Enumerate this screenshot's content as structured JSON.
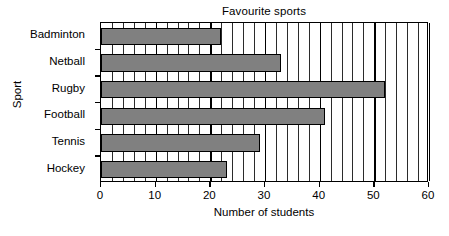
{
  "chart_data": {
    "type": "bar",
    "orientation": "horizontal",
    "title": "Favourite sports",
    "xlabel": "Number of students",
    "ylabel": "Sport",
    "categories": [
      "Badminton",
      "Netball",
      "Rugby",
      "Football",
      "Tennis",
      "Hockey"
    ],
    "values": [
      22,
      33,
      52,
      41,
      29,
      23
    ],
    "xlim": [
      0,
      60
    ],
    "xticks": [
      0,
      10,
      20,
      30,
      40,
      50,
      60
    ],
    "xtick_labels": [
      "0",
      "10",
      "20",
      "30",
      "40",
      "50",
      "60"
    ],
    "gridline_interval": 2,
    "grid": true,
    "legend": false,
    "bar_color": "#808080",
    "bar_border_color": "#000000",
    "background_color": "#ffffff",
    "axis_color": "#000000"
  }
}
